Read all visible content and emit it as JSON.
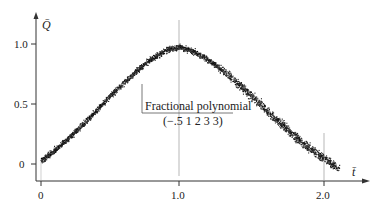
{
  "chart_data": {
    "type": "scatter",
    "title": "",
    "xlabel": "t̄",
    "ylabel": "Q̄",
    "xlim": [
      0,
      2.2
    ],
    "ylim": [
      -0.08,
      1.15
    ],
    "grid": false,
    "legend": null,
    "x_ticks": [
      {
        "value": 0,
        "label": "0"
      },
      {
        "value": 1.0,
        "label": "1.0"
      },
      {
        "value": 2.0,
        "label": "2.0"
      }
    ],
    "y_ticks": [
      {
        "value": 0,
        "label": "0"
      },
      {
        "value": 0.5,
        "label": "0.5"
      },
      {
        "value": 1.0,
        "label": "1.0"
      }
    ],
    "series": [
      {
        "name": "observed (dense scatter band)",
        "x": [
          0.0,
          0.1,
          0.2,
          0.3,
          0.4,
          0.5,
          0.6,
          0.7,
          0.8,
          0.9,
          1.0,
          1.1,
          1.2,
          1.3,
          1.4,
          1.5,
          1.6,
          1.7,
          1.8,
          1.9,
          2.0,
          2.1
        ],
        "values": [
          0.03,
          0.12,
          0.22,
          0.33,
          0.45,
          0.57,
          0.68,
          0.79,
          0.88,
          0.95,
          0.98,
          0.94,
          0.87,
          0.78,
          0.68,
          0.57,
          0.45,
          0.34,
          0.23,
          0.13,
          0.05,
          -0.04
        ]
      }
    ],
    "annotations": [
      {
        "text": "Fractional polynomial",
        "x": 1.0,
        "y": 0.5
      },
      {
        "text": "(−.5 1 2 3 3)",
        "x": 1.0,
        "y": 0.43
      }
    ],
    "reference_lines": [
      {
        "orientation": "vertical",
        "x": 1.0
      },
      {
        "orientation": "vertical",
        "x": 2.0
      }
    ]
  },
  "axes": {
    "y_label": "Q̄",
    "x_label": "t̄",
    "y_tick_labels": [
      "1.0",
      "0.5",
      "0"
    ],
    "x_tick_labels": [
      "0",
      "1.0",
      "2.0"
    ]
  },
  "annotation": {
    "line1": "Fractional polynomial",
    "line2": "(−.5 1 2 3 3)"
  }
}
